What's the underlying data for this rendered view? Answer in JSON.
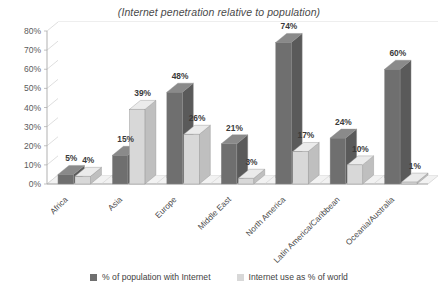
{
  "chart_data": {
    "type": "bar",
    "title": "(Internet penetration relative to population)",
    "xlabel": "",
    "ylabel": "",
    "ylim": [
      0,
      80
    ],
    "ytick_labels": [
      "0%",
      "10%",
      "20%",
      "30%",
      "40%",
      "50%",
      "60%",
      "70%",
      "80%"
    ],
    "ytick_values": [
      0,
      10,
      20,
      30,
      40,
      50,
      60,
      70,
      80
    ],
    "grid": true,
    "legend_position": "bottom",
    "categories": [
      "Africa",
      "Asia",
      "Europe",
      "Middle East",
      "North America",
      "Latin America/Caribbean",
      "Oceania/Australia"
    ],
    "series": [
      {
        "name": "% of population with Internet",
        "color": "#6f6f6f",
        "values": [
          5,
          15,
          48,
          21,
          74,
          24,
          60
        ],
        "value_labels": [
          "5%",
          "15%",
          "48%",
          "21%",
          "74%",
          "24%",
          "60%"
        ]
      },
      {
        "name": "Internet use as % of world",
        "color": "#d8d8d8",
        "values": [
          4,
          39,
          26,
          3,
          17,
          10,
          1
        ],
        "value_labels": [
          "4%",
          "39%",
          "26%",
          "3%",
          "17%",
          "10%",
          "1%"
        ]
      }
    ]
  },
  "legend": {
    "items": [
      {
        "label": "% of population with Internet",
        "swatch": "dark-gray-swatch"
      },
      {
        "label": "Internet use as % of world",
        "swatch": "light-gray-swatch"
      }
    ]
  },
  "colors": {
    "series1": "#6f6f6f",
    "series1_top": "#8a8a8a",
    "series1_side": "#5a5a5a",
    "series2": "#d8d8d8",
    "series2_top": "#ebebeb",
    "series2_side": "#bfbfbf",
    "grid": "#d0d0d0",
    "axis": "#a8a8a8",
    "floor": "#f2f2f2",
    "text": "#3a3a3a"
  }
}
